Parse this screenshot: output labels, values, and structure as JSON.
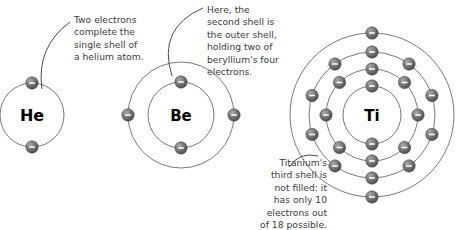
{
  "figure": {
    "background_color": "#ffffff",
    "shell_line_color": "#555555",
    "electron_color": "#6e6e6e",
    "text_color": "#3b3b3b"
  },
  "atoms": [
    {
      "id": "helium",
      "symbol": "He",
      "name": "Helium",
      "center": {
        "x": 32,
        "y": 115
      },
      "symbol_font_size": 16,
      "shells": [
        {
          "index": 1,
          "radius": 32,
          "electron_count": 2,
          "electron_angles": [
            -90,
            90
          ]
        }
      ],
      "total_electrons": 2
    },
    {
      "id": "beryllium",
      "symbol": "Be",
      "name": "Beryllium",
      "center": {
        "x": 181,
        "y": 115
      },
      "symbol_font_size": 15,
      "shells": [
        {
          "index": 1,
          "radius": 33,
          "electron_count": 2,
          "electron_angles": [
            -90,
            90
          ]
        },
        {
          "index": 2,
          "radius": 53,
          "electron_count": 2,
          "electron_angles": [
            180,
            0
          ]
        }
      ],
      "total_electrons": 4
    },
    {
      "id": "titanium",
      "symbol": "Ti",
      "name": "Titanium",
      "center": {
        "x": 372,
        "y": 115
      },
      "symbol_font_size": 15,
      "shells": [
        {
          "index": 1,
          "radius": 29,
          "electron_count": 2,
          "electron_angles": [
            -90,
            90
          ]
        },
        {
          "index": 2,
          "radius": 46,
          "electron_count": 8,
          "electron_angles": [
            -90,
            -45,
            0,
            45,
            90,
            135,
            180,
            225
          ]
        },
        {
          "index": 3,
          "radius": 63,
          "electron_count": 10,
          "electron_angles": [
            -90,
            -54,
            -18,
            18,
            54,
            90,
            126,
            162,
            198,
            234
          ]
        },
        {
          "index": 4,
          "radius": 82,
          "electron_count": 2,
          "electron_angles": [
            -90,
            90
          ]
        }
      ],
      "total_electrons": 22
    }
  ],
  "captions": {
    "helium": {
      "text": "Two electrons\ncomplete the\nsingle shell of\na helium atom.",
      "leader_from": {
        "x": 70,
        "y": 22
      },
      "leader_to": {
        "x": 42,
        "y": 89
      }
    },
    "beryllium": {
      "text": "Here, the\nsecond shell is\nthe outer shell,\nholding two of\nberyllium's four\nelectrons.",
      "leader_from": {
        "x": 203,
        "y": 8
      },
      "leader_to": {
        "x": 172,
        "y": 76
      }
    },
    "titanium": {
      "text": "Titanium's\nthird shell is\nnot filled: it\nhas only 10\nelectrons out\nof 18 possible.",
      "leader_from": {
        "x": 289,
        "y": 167
      },
      "leader_to": {
        "x": 318,
        "y": 156
      }
    }
  },
  "electron_symbol": "−"
}
